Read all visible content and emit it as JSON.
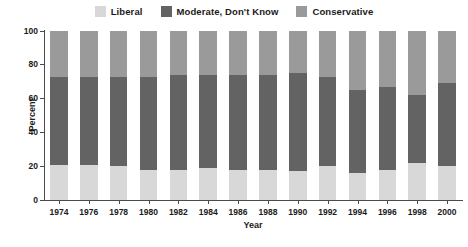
{
  "legend": {
    "entries": [
      {
        "label": "Liberal",
        "color": "#d8d8d8",
        "swatch_name": "legend-swatch-liberal"
      },
      {
        "label": "Moderate, Don't Know",
        "color": "#636363",
        "swatch_name": "legend-swatch-moderate"
      },
      {
        "label": "Conservative",
        "color": "#9a9a9a",
        "swatch_name": "legend-swatch-conservative"
      }
    ]
  },
  "axes": {
    "y_title": "Percent",
    "x_title": "Year",
    "y_ticks": [
      "0",
      "20",
      "40",
      "60",
      "80",
      "100"
    ],
    "y_min": 0,
    "y_max": 100
  },
  "chart_data": {
    "type": "bar",
    "subtype": "stacked-percent-column",
    "title": "",
    "subtitle": "",
    "xlabel": "Year",
    "ylabel": "Percent",
    "ylim": [
      0,
      100
    ],
    "yticks": [
      0,
      20,
      40,
      60,
      80,
      100
    ],
    "grid": false,
    "legend_position": "top-center",
    "stack_order_bottom_to_top": [
      "Liberal",
      "Moderate, Don't Know",
      "Conservative"
    ],
    "categories": [
      "1974",
      "1976",
      "1978",
      "1980",
      "1982",
      "1984",
      "1986",
      "1988",
      "1990",
      "1992",
      "1994",
      "1996",
      "1998",
      "2000"
    ],
    "series": [
      {
        "name": "Liberal",
        "color": "#d8d8d8",
        "values": [
          21,
          21,
          20,
          18,
          18,
          19,
          18,
          18,
          17,
          20,
          16,
          18,
          22,
          20
        ]
      },
      {
        "name": "Moderate, Don't Know",
        "color": "#636363",
        "values": [
          52,
          52,
          53,
          55,
          56,
          55,
          56,
          56,
          58,
          53,
          49,
          49,
          40,
          49
        ]
      },
      {
        "name": "Conservative",
        "color": "#9a9a9a",
        "values": [
          27,
          27,
          27,
          27,
          26,
          26,
          26,
          26,
          25,
          27,
          35,
          33,
          38,
          31
        ]
      }
    ],
    "cumulative_tops": {
      "liberal_top": [
        21,
        21,
        20,
        18,
        18,
        19,
        18,
        18,
        17,
        20,
        16,
        18,
        22,
        20
      ],
      "moderate_top": [
        73,
        73,
        73,
        73,
        74,
        74,
        74,
        74,
        75,
        73,
        65,
        67,
        62,
        69
      ]
    }
  }
}
